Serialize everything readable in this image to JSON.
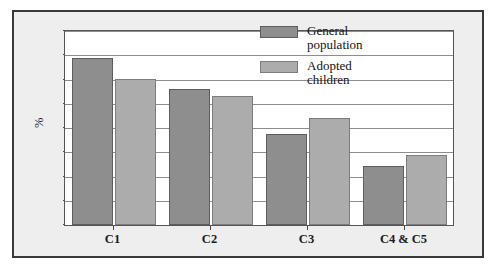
{
  "chart_data": {
    "type": "bar",
    "title": "",
    "xlabel": "",
    "ylabel": "%",
    "categories": [
      "C1",
      "C2",
      "C3",
      "C4 & C5"
    ],
    "series": [
      {
        "name": "General population",
        "values": [
          69,
          56,
          37.5,
          24.5
        ],
        "color": "#8e8e8e"
      },
      {
        "name": "Adopted children",
        "values": [
          60,
          53,
          44,
          29
        ],
        "color": "#acacac"
      }
    ],
    "ylim": [
      0,
      80
    ],
    "yticks": [
      0,
      20,
      40,
      60,
      80
    ],
    "ytick_labels": [
      "0",
      "20",
      "40",
      "60",
      "80"
    ],
    "yminor_ticks": [
      10,
      30,
      50,
      70
    ],
    "grid": true,
    "legend_position": "top-right"
  },
  "legend": {
    "entries": [
      {
        "label": "General\npopulation",
        "swatch": "general"
      },
      {
        "label": "Adopted\nchildren",
        "swatch": "adopted"
      }
    ]
  },
  "colors": {
    "general": "#8e8e8e",
    "adopted": "#acacac",
    "frame": "#3a3a3a",
    "figure_background": "#eeeeee",
    "plot_background": "#ffffff",
    "gridline": "#8d8d8d"
  }
}
